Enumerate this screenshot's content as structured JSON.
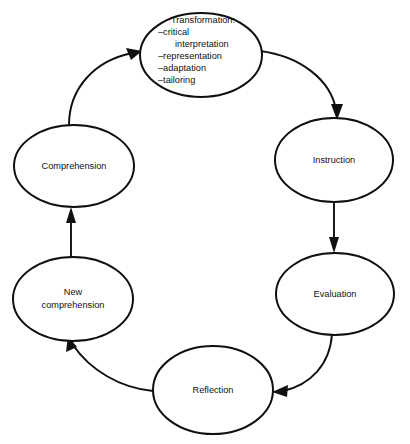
{
  "diagram": {
    "background_color": "#ffffff",
    "stroke_color": "#101010",
    "text_color": "#111111",
    "nodes": [
      {
        "id": "transformation",
        "label": "Transformation:",
        "items": [
          "–critical",
          "interpretation",
          "–representation",
          "–adaptation",
          "–tailoring"
        ]
      },
      {
        "id": "instruction",
        "label": "Instruction"
      },
      {
        "id": "evaluation",
        "label": "Evaluation"
      },
      {
        "id": "reflection",
        "label": "Reflection"
      },
      {
        "id": "new-comprehension",
        "label_line1": "New",
        "label_line2": "comprehension"
      },
      {
        "id": "comprehension",
        "label": "Comprehension"
      }
    ],
    "edges": [
      {
        "from": "comprehension",
        "to": "transformation",
        "style": "curved"
      },
      {
        "from": "transformation",
        "to": "instruction",
        "style": "curved"
      },
      {
        "from": "instruction",
        "to": "evaluation",
        "style": "straight"
      },
      {
        "from": "evaluation",
        "to": "reflection",
        "style": "curved"
      },
      {
        "from": "reflection",
        "to": "new-comprehension",
        "style": "curved"
      },
      {
        "from": "new-comprehension",
        "to": "comprehension",
        "style": "straight"
      }
    ]
  }
}
